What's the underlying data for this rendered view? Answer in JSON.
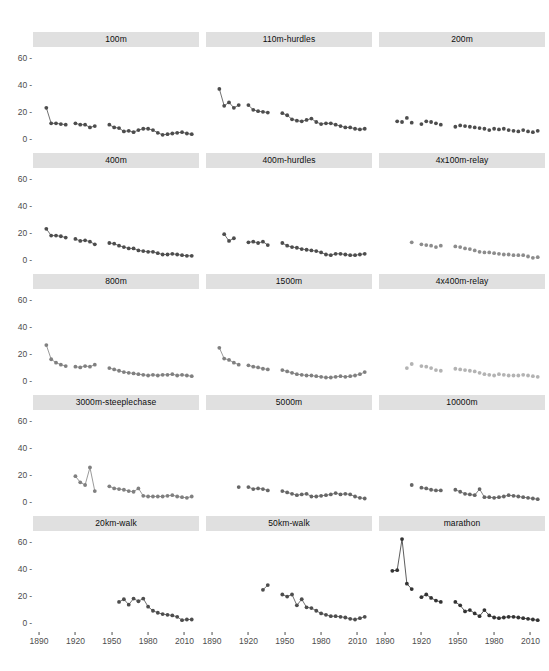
{
  "figure": {
    "title": "",
    "background": "#ffffff",
    "strip_background": "#e0e0e0",
    "axis_text_color": "#4d4d4d",
    "grid": false,
    "facet_rows": 5,
    "facet_cols": 3
  },
  "axes": {
    "x": {
      "label": "",
      "ticks": [
        1890,
        1920,
        1950,
        1980,
        2010
      ],
      "tick_labels": [
        "1890",
        "1920",
        "1950",
        "1980",
        "2010"
      ],
      "range": [
        1885,
        2022
      ]
    },
    "y": {
      "label": "",
      "ticks": [
        0,
        20,
        40,
        60
      ],
      "tick_labels": [
        "0",
        "20",
        "40",
        "60"
      ],
      "range": [
        -6,
        68
      ]
    }
  },
  "chart_data": {
    "type": "scatter",
    "title": "",
    "xlabel": "",
    "ylabel": "",
    "xlim": [
      1885,
      2022
    ],
    "ylim": [
      -6,
      68
    ],
    "grid": false,
    "legend": "none",
    "facets": [
      {
        "name": "100m",
        "color": "#4d4d4d",
        "lines": true,
        "x": [
          1896,
          1900,
          1904,
          1908,
          1912,
          1920,
          1924,
          1928,
          1932,
          1936,
          1948,
          1952,
          1956,
          1960,
          1964,
          1968,
          1972,
          1976,
          1980,
          1984,
          1988,
          1992,
          1996,
          2000,
          2004,
          2008,
          2012,
          2016
        ],
        "y": [
          23.0,
          11.5,
          11.5,
          11.0,
          10.5,
          11.5,
          10.5,
          10.5,
          8.5,
          9.5,
          10.5,
          8.5,
          8.0,
          5.5,
          6.0,
          5.0,
          6.5,
          7.5,
          7.5,
          6.5,
          4.5,
          3.0,
          3.5,
          4.0,
          4.5,
          5.0,
          4.0,
          3.5,
          2.5,
          2.0,
          2.0,
          2.5,
          2.0,
          1.0,
          0.5,
          2.0
        ]
      },
      {
        "name": "110m-hurdles",
        "color": "#4d4d4d",
        "lines": true,
        "x": [
          1896,
          1900,
          1904,
          1908,
          1912,
          1920,
          1924,
          1928,
          1932,
          1936,
          1948,
          1952,
          1956,
          1960,
          1964,
          1968,
          1972,
          1976,
          1980,
          1984,
          1988,
          1992,
          1996,
          2000,
          2004,
          2008,
          2012,
          2016
        ],
        "y": [
          37.0,
          24.5,
          27.0,
          23.0,
          25.0,
          25.0,
          21.5,
          20.5,
          20.0,
          19.5,
          19.0,
          17.5,
          14.5,
          13.5,
          13.0,
          14.0,
          15.0,
          12.5,
          11.0,
          11.5,
          11.5,
          10.5,
          9.5,
          8.5,
          8.5,
          7.5,
          7.0,
          7.5,
          7.0,
          7.0,
          7.0,
          8.0
        ]
      },
      {
        "name": "200m",
        "color": "#4d4d4d",
        "lines": false,
        "x": [
          1900,
          1904,
          1908,
          1912,
          1920,
          1924,
          1928,
          1932,
          1936,
          1948,
          1952,
          1956,
          1960,
          1964,
          1968,
          1972,
          1976,
          1980,
          1984,
          1988,
          1992,
          1996,
          2000,
          2004,
          2008,
          2012,
          2016
        ],
        "y": [
          13.0,
          12.5,
          15.5,
          12.0,
          11.0,
          13.0,
          12.5,
          11.5,
          10.5,
          9.0,
          10.0,
          9.5,
          9.0,
          8.5,
          8.0,
          7.5,
          6.5,
          7.5,
          7.0,
          7.5,
          6.5,
          6.0,
          5.5,
          6.5,
          5.5,
          5.0,
          6.0
        ]
      },
      {
        "name": "400m",
        "color": "#4d4d4d",
        "lines": true,
        "x": [
          1896,
          1900,
          1904,
          1908,
          1912,
          1920,
          1924,
          1928,
          1932,
          1936,
          1948,
          1952,
          1956,
          1960,
          1964,
          1968,
          1972,
          1976,
          1980,
          1984,
          1988,
          1992,
          1996,
          2000,
          2004,
          2008,
          2012,
          2016
        ],
        "y": [
          23.0,
          18.0,
          18.0,
          17.5,
          16.5,
          15.5,
          14.0,
          14.5,
          13.5,
          11.5,
          12.5,
          12.0,
          10.5,
          9.5,
          8.5,
          8.5,
          7.0,
          6.5,
          6.0,
          6.0,
          5.0,
          4.0,
          4.0,
          4.5,
          4.0,
          3.5,
          3.0,
          3.0,
          2.5,
          2.5,
          2.0,
          1.5
        ]
      },
      {
        "name": "400m-hurdles",
        "color": "#4d4d4d",
        "lines": true,
        "x": [
          1900,
          1904,
          1908,
          1920,
          1924,
          1928,
          1932,
          1936,
          1948,
          1952,
          1956,
          1960,
          1964,
          1968,
          1972,
          1976,
          1980,
          1984,
          1988,
          1992,
          1996,
          2000,
          2004,
          2008,
          2012,
          2016
        ],
        "y": [
          19.0,
          14.0,
          16.0,
          13.0,
          13.5,
          12.5,
          13.5,
          11.0,
          12.5,
          10.5,
          9.5,
          9.0,
          8.0,
          7.5,
          7.0,
          6.5,
          5.5,
          4.0,
          3.5,
          4.5,
          4.5,
          4.0,
          3.5,
          3.5,
          4.0,
          4.5
        ]
      },
      {
        "name": "4x100m-relay",
        "color": "#8c8c8c",
        "lines": false,
        "x": [
          1912,
          1920,
          1924,
          1928,
          1932,
          1936,
          1948,
          1952,
          1956,
          1960,
          1964,
          1968,
          1972,
          1976,
          1980,
          1984,
          1988,
          1992,
          1996,
          2000,
          2004,
          2008,
          2012,
          2016
        ],
        "y": [
          13.0,
          11.5,
          11.0,
          10.5,
          9.5,
          10.5,
          10.0,
          9.5,
          8.5,
          8.0,
          7.0,
          6.0,
          5.5,
          5.5,
          5.0,
          4.5,
          4.0,
          4.0,
          3.5,
          3.5,
          3.5,
          2.5,
          1.5,
          2.0
        ]
      },
      {
        "name": "800m",
        "color": "#808080",
        "lines": true,
        "x": [
          1896,
          1900,
          1904,
          1908,
          1912,
          1920,
          1924,
          1928,
          1932,
          1936,
          1948,
          1952,
          1956,
          1960,
          1964,
          1968,
          1972,
          1976,
          1980,
          1984,
          1988,
          1992,
          1996,
          2000,
          2004,
          2008,
          2012,
          2016
        ],
        "y": [
          26.5,
          16.0,
          13.5,
          12.0,
          11.0,
          10.5,
          10.0,
          11.0,
          10.5,
          12.0,
          9.5,
          8.5,
          7.5,
          6.5,
          6.0,
          5.5,
          5.0,
          4.5,
          4.0,
          4.5,
          4.0,
          4.5,
          4.5,
          5.0,
          4.0,
          4.5,
          4.0,
          3.5,
          3.0,
          2.0
        ]
      },
      {
        "name": "1500m",
        "color": "#808080",
        "lines": true,
        "x": [
          1896,
          1900,
          1904,
          1908,
          1912,
          1920,
          1924,
          1928,
          1932,
          1936,
          1948,
          1952,
          1956,
          1960,
          1964,
          1968,
          1972,
          1976,
          1980,
          1984,
          1988,
          1992,
          1996,
          2000,
          2004,
          2008,
          2012,
          2016
        ],
        "y": [
          24.5,
          16.5,
          15.5,
          13.5,
          12.0,
          11.5,
          10.5,
          10.0,
          9.0,
          8.5,
          8.0,
          7.0,
          6.0,
          5.0,
          4.5,
          4.0,
          4.0,
          3.5,
          3.0,
          2.5,
          2.5,
          3.0,
          3.5,
          3.0,
          3.5,
          4.0,
          5.0,
          6.5
        ]
      },
      {
        "name": "4x400m-relay",
        "color": "#b3b3b3",
        "lines": false,
        "x": [
          1908,
          1912,
          1920,
          1924,
          1928,
          1932,
          1936,
          1948,
          1952,
          1956,
          1960,
          1964,
          1968,
          1972,
          1976,
          1980,
          1984,
          1988,
          1992,
          1996,
          2000,
          2004,
          2008,
          2012,
          2016
        ],
        "y": [
          9.5,
          12.5,
          11.0,
          10.5,
          9.5,
          8.0,
          7.5,
          9.0,
          8.5,
          8.0,
          7.5,
          7.0,
          6.0,
          5.0,
          4.5,
          4.0,
          5.0,
          4.5,
          4.0,
          4.0,
          4.0,
          4.5,
          4.0,
          3.5,
          3.0
        ]
      },
      {
        "name": "3000m-steeplechase",
        "color": "#808080",
        "lines": true,
        "x": [
          1920,
          1924,
          1928,
          1932,
          1936,
          1948,
          1952,
          1956,
          1960,
          1964,
          1968,
          1972,
          1976,
          1980,
          1984,
          1988,
          1992,
          1996,
          2000,
          2004,
          2008,
          2012,
          2016
        ],
        "y": [
          19.0,
          14.5,
          12.5,
          25.5,
          8.0,
          11.5,
          10.0,
          9.5,
          9.0,
          8.0,
          7.5,
          10.0,
          4.5,
          4.0,
          4.0,
          4.0,
          4.0,
          4.5,
          5.0,
          4.0,
          3.5,
          3.0,
          4.0,
          3.5,
          2.5
        ]
      },
      {
        "name": "5000m",
        "color": "#666666",
        "lines": true,
        "x": [
          1912,
          1920,
          1924,
          1928,
          1932,
          1936,
          1948,
          1952,
          1956,
          1960,
          1964,
          1968,
          1972,
          1976,
          1980,
          1984,
          1988,
          1992,
          1996,
          2000,
          2004,
          2008,
          2012,
          2016
        ],
        "y": [
          11.0,
          11.0,
          9.5,
          10.0,
          9.5,
          8.5,
          8.0,
          7.0,
          6.0,
          5.0,
          5.5,
          6.0,
          4.0,
          4.0,
          4.5,
          5.0,
          5.5,
          6.5,
          5.5,
          6.0,
          5.5,
          4.0,
          3.0,
          2.5
        ]
      },
      {
        "name": "10000m",
        "color": "#666666",
        "lines": true,
        "x": [
          1912,
          1920,
          1924,
          1928,
          1932,
          1936,
          1948,
          1952,
          1956,
          1960,
          1964,
          1968,
          1972,
          1976,
          1980,
          1984,
          1988,
          1992,
          1996,
          2000,
          2004,
          2008,
          2012,
          2016
        ],
        "y": [
          12.5,
          10.5,
          10.0,
          9.0,
          8.5,
          8.5,
          9.0,
          7.5,
          6.0,
          5.5,
          5.0,
          9.5,
          3.5,
          3.5,
          3.0,
          3.5,
          4.0,
          5.0,
          4.5,
          4.0,
          3.5,
          3.0,
          2.5,
          2.0
        ]
      },
      {
        "name": "20km-walk",
        "color": "#4d4d4d",
        "lines": true,
        "x": [
          1956,
          1960,
          1964,
          1968,
          1972,
          1976,
          1980,
          1984,
          1988,
          1992,
          1996,
          2000,
          2004,
          2008,
          2012,
          2016
        ],
        "y": [
          15.5,
          17.5,
          13.5,
          18.0,
          16.0,
          18.0,
          12.0,
          9.0,
          7.5,
          6.5,
          6.0,
          5.5,
          4.5,
          2.0,
          2.5,
          2.5,
          2.0,
          2.0,
          1.5,
          1.5
        ]
      },
      {
        "name": "50km-walk",
        "color": "#4d4d4d",
        "lines": true,
        "x": [
          1932,
          1936,
          1948,
          1952,
          1956,
          1960,
          1964,
          1968,
          1972,
          1976,
          1980,
          1984,
          1988,
          1992,
          1996,
          2000,
          2004,
          2008,
          2012,
          2016
        ],
        "y": [
          24.5,
          28.0,
          21.0,
          19.5,
          21.0,
          13.0,
          17.5,
          11.5,
          11.0,
          9.0,
          7.0,
          6.0,
          5.0,
          5.0,
          4.5,
          4.0,
          3.0,
          2.5,
          3.5,
          4.5
        ]
      },
      {
        "name": "marathon",
        "color": "#333333",
        "lines": true,
        "x": [
          1896,
          1900,
          1904,
          1908,
          1912,
          1920,
          1924,
          1928,
          1932,
          1936,
          1948,
          1952,
          1956,
          1960,
          1964,
          1968,
          1972,
          1976,
          1980,
          1984,
          1988,
          1992,
          1996,
          2000,
          2004,
          2008,
          2012,
          2016
        ],
        "y": [
          38.5,
          39.0,
          62.0,
          29.0,
          25.0,
          19.0,
          21.0,
          18.5,
          16.5,
          15.5,
          15.5,
          13.0,
          8.5,
          9.5,
          7.0,
          5.0,
          9.5,
          5.5,
          4.0,
          3.5,
          4.0,
          4.5,
          4.5,
          4.0,
          3.5,
          3.0,
          2.5,
          2.0
        ]
      }
    ]
  }
}
